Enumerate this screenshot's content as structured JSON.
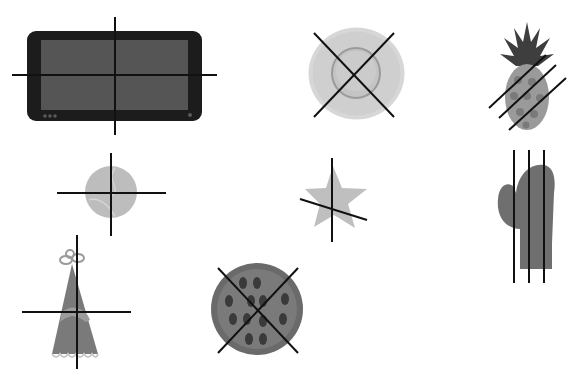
{
  "scene": {
    "background": "#ffffff",
    "stroke_color": "#111111",
    "objects": [
      {
        "id": "tablet",
        "label": "tablet",
        "fill": "#555555",
        "frame": "#1c1c1c"
      },
      {
        "id": "plate",
        "label": "plate",
        "fill": "#cfcfcf",
        "inner": "#bdbdbd"
      },
      {
        "id": "pineapple",
        "label": "pineapple",
        "fill": "#9a9a9a",
        "leaves": "#3e3e3e"
      },
      {
        "id": "ball",
        "label": "ball",
        "fill": "#bdbdbd"
      },
      {
        "id": "star",
        "label": "star",
        "fill": "#bfbfbf"
      },
      {
        "id": "mitten",
        "label": "mitten",
        "fill": "#6f6f6f"
      },
      {
        "id": "party-hat",
        "label": "party hat",
        "fill": "#7a7a7a",
        "band": "#9c9c9c"
      },
      {
        "id": "pizza",
        "label": "pizza",
        "fill": "#6a6a6a",
        "toppings": "#3a3a3a"
      }
    ],
    "cut_lines": [
      {
        "object": "tablet",
        "lines": [
          [
            12,
            75,
            217,
            75
          ],
          [
            115,
            17,
            115,
            135
          ]
        ]
      },
      {
        "object": "plate",
        "lines": [
          [
            314,
            33,
            394,
            117
          ],
          [
            394,
            33,
            314,
            117
          ]
        ]
      },
      {
        "object": "pineapple",
        "lines": [
          [
            489,
            108,
            546,
            55
          ],
          [
            499,
            118,
            556,
            65
          ],
          [
            509,
            130,
            566,
            78
          ]
        ]
      },
      {
        "object": "ball",
        "lines": [
          [
            57,
            193,
            166,
            193
          ],
          [
            111,
            153,
            111,
            236
          ]
        ]
      },
      {
        "object": "star",
        "lines": [
          [
            300,
            199,
            367,
            220
          ],
          [
            332,
            158,
            332,
            242
          ]
        ]
      },
      {
        "object": "mitten",
        "lines": [
          [
            514,
            150,
            514,
            283
          ],
          [
            529,
            150,
            529,
            283
          ],
          [
            544,
            150,
            544,
            283
          ]
        ]
      },
      {
        "object": "party-hat",
        "lines": [
          [
            22,
            312,
            131,
            312
          ],
          [
            77,
            235,
            77,
            369
          ]
        ]
      },
      {
        "object": "pizza",
        "lines": [
          [
            218,
            268,
            298,
            353
          ],
          [
            298,
            268,
            218,
            353
          ]
        ]
      }
    ]
  }
}
